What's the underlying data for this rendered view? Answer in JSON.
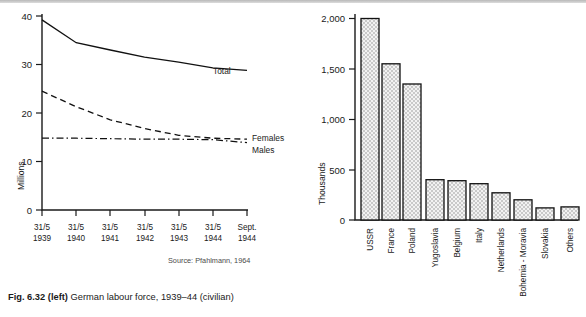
{
  "figure": {
    "caption_bold": "Fig. 6.32 (left)",
    "caption_rest": "German labour force, 1939–44 (civilian)"
  },
  "left_chart": {
    "source": "Source: Pfahlmann, 1964",
    "ylabel": "Millions",
    "series_labels": {
      "total": "Total",
      "females": "Females",
      "males": "Males"
    }
  },
  "right_chart": {
    "source": "Source: Kulischer, 1943",
    "ylabel": "Thousands"
  },
  "chart_data": [
    {
      "type": "line",
      "title": "German labour force, 1939–44 (civilian)",
      "xlabel": "",
      "ylabel": "Millions",
      "ylim": [
        0,
        40
      ],
      "yticks": [
        0,
        10,
        20,
        30,
        40
      ],
      "ytick_labels": [
        "0",
        "10",
        "20",
        "30",
        "40"
      ],
      "x": [
        "31/5 1939",
        "31/5 1940",
        "31/5 1941",
        "31/5 1942",
        "31/5 1943",
        "31/5 1944",
        "Sept. 1944"
      ],
      "xtick_labels_line1": [
        "31/5",
        "31/5",
        "31/5",
        "31/5",
        "31/5",
        "31/5",
        "Sept."
      ],
      "xtick_labels_line2": [
        "1939",
        "1940",
        "1941",
        "1942",
        "1943",
        "1944",
        "1944"
      ],
      "grid": false,
      "legend": "inline-right",
      "series": [
        {
          "name": "Total",
          "style": "solid",
          "values": [
            39.2,
            34.5,
            33.0,
            31.5,
            30.5,
            29.3,
            28.8
          ]
        },
        {
          "name": "Females",
          "style": "dashed",
          "values": [
            24.5,
            21.3,
            18.6,
            16.8,
            15.4,
            14.8,
            14.6
          ]
        },
        {
          "name": "Males",
          "style": "dash-dot",
          "values": [
            14.8,
            14.8,
            14.7,
            14.6,
            14.6,
            14.5,
            13.9
          ]
        }
      ],
      "source": "Source: Pfahlmann, 1964"
    },
    {
      "type": "bar",
      "title": "",
      "xlabel": "",
      "ylabel": "Thousands",
      "ylim": [
        0,
        2000
      ],
      "yticks": [
        0,
        500,
        1000,
        1500,
        2000
      ],
      "ytick_labels": [
        "0",
        "500",
        "1,000",
        "1,500",
        "2,000"
      ],
      "grid": false,
      "categories": [
        "USSR",
        "France",
        "Poland",
        "Yugoslavia",
        "Belgium",
        "Italy",
        "Netherlands",
        "Bohemia - Moravia",
        "Slovakia",
        "Others"
      ],
      "values": [
        2000,
        1550,
        1350,
        400,
        390,
        360,
        270,
        200,
        120,
        130
      ],
      "source": "Source: Kulischer, 1943"
    }
  ]
}
